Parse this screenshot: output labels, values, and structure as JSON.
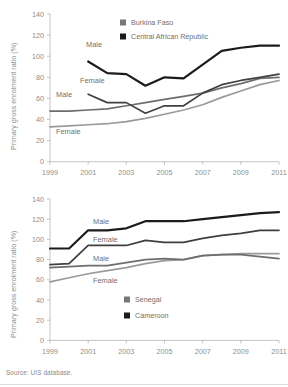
{
  "figure": {
    "source_note": "Source: UIS database."
  },
  "chart_data": [
    {
      "type": "line",
      "panel": "top",
      "title": "",
      "xlabel": "",
      "ylabel": "Primary gross enrolment ratio (%)",
      "x": [
        1999,
        2000,
        2001,
        2002,
        2003,
        2004,
        2005,
        2006,
        2007,
        2008,
        2009,
        2010,
        2011
      ],
      "xlim": [
        1999,
        2011
      ],
      "ylim": [
        0,
        140
      ],
      "yticks": [
        0,
        20,
        40,
        60,
        80,
        100,
        120,
        140
      ],
      "xticks": [
        1999,
        2001,
        2003,
        2005,
        2007,
        2009,
        2011
      ],
      "xticklabels": [
        "1999",
        "2001",
        "2003",
        "2005",
        "2007",
        "2009",
        "2011"
      ],
      "grid": false,
      "legend_position": "top-center",
      "legend": [
        {
          "label": "Burkina Faso",
          "color": "#787878"
        },
        {
          "label": "Central African Republic",
          "color": "#1b1b1b"
        }
      ],
      "series": [
        {
          "name": "Central African Republic Male",
          "country": "Central African Republic",
          "sex": "Male",
          "color": "#1b1b1b",
          "inline_label": "Male",
          "x": [
            2001,
            2002,
            2003,
            2004,
            2005,
            2006,
            2007,
            2008,
            2009,
            2010,
            2011
          ],
          "values": [
            95,
            84,
            83,
            72,
            80,
            79,
            92,
            105,
            108,
            110,
            110
          ]
        },
        {
          "name": "Central African Republic Female",
          "country": "Central African Republic",
          "sex": "Female",
          "color": "#404040",
          "inline_label": "Female",
          "x": [
            2001,
            2002,
            2003,
            2004,
            2005,
            2006,
            2007,
            2008,
            2009,
            2010,
            2011
          ],
          "values": [
            64,
            56,
            56,
            46,
            53,
            53,
            65,
            73,
            77,
            80,
            83
          ]
        },
        {
          "name": "Burkina Faso Male",
          "country": "Burkina Faso",
          "sex": "Male",
          "color": "#6e6e6e",
          "inline_label": "Male",
          "x": [
            1999,
            2000,
            2001,
            2002,
            2003,
            2004,
            2005,
            2006,
            2007,
            2008,
            2009,
            2010,
            2011
          ],
          "values": [
            48,
            48,
            49,
            50,
            53,
            56,
            59,
            62,
            65,
            70,
            74,
            79,
            80
          ]
        },
        {
          "name": "Burkina Faso Female",
          "country": "Burkina Faso",
          "sex": "Female",
          "color": "#9a9a9a",
          "inline_label": "Female",
          "x": [
            1999,
            2000,
            2001,
            2002,
            2003,
            2004,
            2005,
            2006,
            2007,
            2008,
            2009,
            2010,
            2011
          ],
          "values": [
            33,
            34,
            35,
            36,
            38,
            41,
            45,
            49,
            54,
            61,
            67,
            73,
            77
          ]
        }
      ]
    },
    {
      "type": "line",
      "panel": "bottom",
      "title": "",
      "xlabel": "",
      "ylabel": "Primary gross enrolment ratio (%)",
      "x": [
        1999,
        2000,
        2001,
        2002,
        2003,
        2004,
        2005,
        2006,
        2007,
        2008,
        2009,
        2010,
        2011
      ],
      "xlim": [
        1999,
        2011
      ],
      "ylim": [
        0,
        140
      ],
      "yticks": [
        0,
        20,
        40,
        60,
        80,
        100,
        120,
        140
      ],
      "xticks": [
        1999,
        2001,
        2003,
        2005,
        2007,
        2009,
        2011
      ],
      "xticklabels": [
        "1999",
        "2001",
        "2003",
        "2005",
        "2007",
        "2009",
        "2011"
      ],
      "grid": false,
      "legend_position": "center",
      "legend": [
        {
          "label": "Senegal",
          "color": "#787878"
        },
        {
          "label": "Cameroon",
          "color": "#1b1b1b"
        }
      ],
      "series": [
        {
          "name": "Cameroon Male",
          "country": "Cameroon",
          "sex": "Male",
          "color": "#1b1b1b",
          "inline_label": "Male",
          "x": [
            1999,
            2000,
            2001,
            2002,
            2003,
            2004,
            2005,
            2006,
            2007,
            2008,
            2009,
            2010,
            2011
          ],
          "values": [
            91,
            91,
            109,
            109,
            111,
            118,
            118,
            118,
            120,
            122,
            124,
            126,
            127
          ]
        },
        {
          "name": "Cameroon Female",
          "country": "Cameroon",
          "sex": "Female",
          "color": "#3f3f3f",
          "inline_label": "Female",
          "x": [
            1999,
            2000,
            2001,
            2002,
            2003,
            2004,
            2005,
            2006,
            2007,
            2008,
            2009,
            2010,
            2011
          ],
          "values": [
            75,
            76,
            94,
            94,
            94,
            99,
            97,
            97,
            101,
            104,
            106,
            109,
            109
          ]
        },
        {
          "name": "Senegal Male",
          "country": "Senegal",
          "sex": "Male",
          "color": "#6e6e6e",
          "inline_label": "Male",
          "x": [
            1999,
            2000,
            2001,
            2002,
            2003,
            2004,
            2005,
            2006,
            2007,
            2008,
            2009,
            2010,
            2011
          ],
          "values": [
            72,
            73,
            74,
            74,
            77,
            80,
            81,
            80,
            84,
            85,
            85,
            83,
            81
          ]
        },
        {
          "name": "Senegal Female",
          "country": "Senegal",
          "sex": "Female",
          "color": "#9a9a9a",
          "inline_label": "Female",
          "x": [
            1999,
            2000,
            2001,
            2002,
            2003,
            2004,
            2005,
            2006,
            2007,
            2008,
            2009,
            2010,
            2011
          ],
          "values": [
            58,
            62,
            66,
            69,
            72,
            76,
            79,
            80,
            84,
            85,
            86,
            86,
            86
          ]
        }
      ]
    }
  ]
}
